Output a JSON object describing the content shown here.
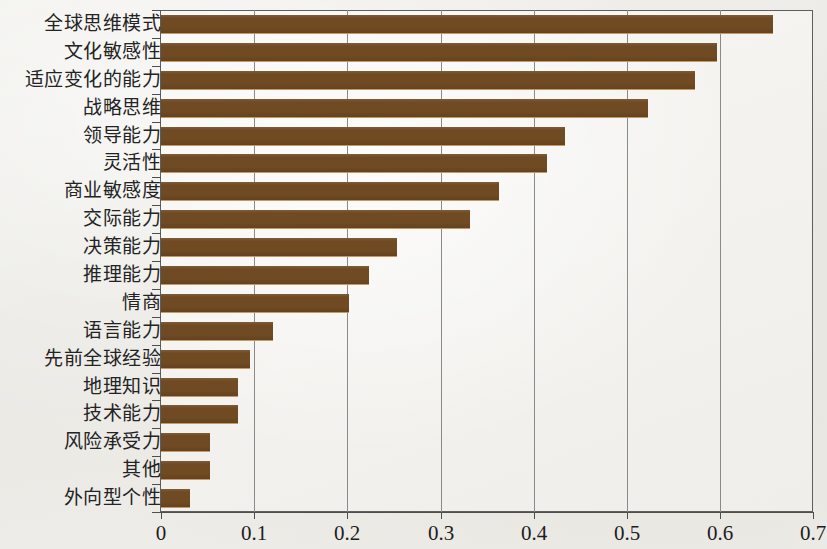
{
  "chart_data": {
    "type": "bar",
    "orientation": "horizontal",
    "title": "",
    "xlabel": "",
    "ylabel": "",
    "xlim": [
      0,
      0.7
    ],
    "xticks": [
      "0",
      "0.1",
      "0.2",
      "0.3",
      "0.4",
      "0.5",
      "0.6",
      "0.7"
    ],
    "xtick_values": [
      0,
      0.1,
      0.2,
      0.3,
      0.4,
      0.5,
      0.6,
      0.7
    ],
    "grid": "vertical",
    "legend": "none",
    "bar_color": "#6f4a23",
    "categories": [
      "全球思维模式",
      "文化敏感性",
      "适应变化的能力",
      "战略思维",
      "领导能力",
      "灵活性",
      "商业敏感度",
      "交际能力",
      "决策能力",
      "推理能力",
      "情商",
      "语言能力",
      "先前全球经验",
      "地理知识",
      "技术能力",
      "风险承受力",
      "其他",
      "外向型个性"
    ],
    "values": [
      0.657,
      0.597,
      0.573,
      0.523,
      0.433,
      0.414,
      0.363,
      0.332,
      0.253,
      0.223,
      0.202,
      0.12,
      0.095,
      0.083,
      0.083,
      0.053,
      0.053,
      0.031
    ]
  }
}
